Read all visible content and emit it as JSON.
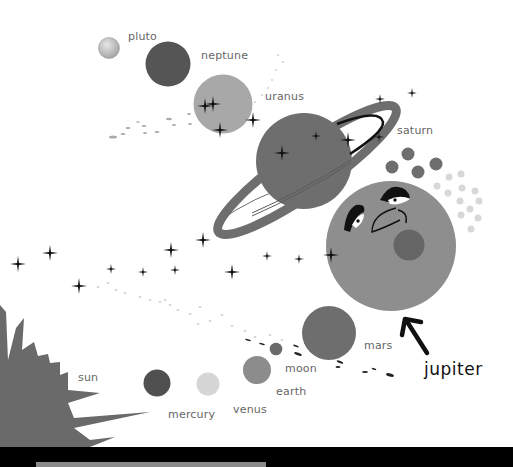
{
  "scene": {
    "background": "#ffffff",
    "labels": {
      "pluto": "pluto",
      "neptune": "neptune",
      "uranus": "uranus",
      "saturn": "saturn",
      "jupiter": "jupiter",
      "mars": "mars",
      "moon": "moon",
      "earth": "earth",
      "venus": "venus",
      "mercury": "mercury",
      "sun": "sun"
    },
    "colors": {
      "pluto": "#c8c8c8",
      "neptune": "#555555",
      "uranus": "#a8a8a8",
      "saturn": "#6e6e6e",
      "jupiter": "#8e8e8e",
      "jupiter_spot": "#666666",
      "mars": "#6e6e6e",
      "moon": "#6a6a6a",
      "earth": "#8c8c8c",
      "venus": "#d6d6d6",
      "mercury": "#505050",
      "sun": "#6a6a6a",
      "moons_dark": "#6e6e6e",
      "moons_light": "#d8d8d8",
      "stars": "#111111",
      "bottom_bar": "#000000",
      "bottom_strip": "#8a8a8a"
    }
  }
}
